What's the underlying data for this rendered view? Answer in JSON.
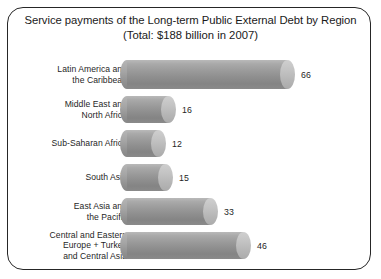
{
  "figure": {
    "title_line1": "Service payments of the Long-term Public External Debt by Region",
    "title_line2": "(Total: $188 billion in 2007)",
    "frame_color": "#262626",
    "bar_color": "#9a9a9a",
    "bar_cap_color": "#c3c3c3",
    "background": "#ffffff",
    "text_color": "#1f1f1f"
  },
  "chart_data": {
    "type": "bar",
    "orientation": "horizontal",
    "title": "Service payments of the Long-term Public External Debt by Region",
    "subtitle": "(Total: $188 billion in 2007)",
    "xlabel": "",
    "ylabel": "",
    "units": "US$ billion",
    "total": 188,
    "year": 2007,
    "grid": false,
    "legend": "none",
    "xlim": [
      0,
      70
    ],
    "categories": [
      "Latin America and the Caribbean",
      "Middle East and North Africa",
      "Sub-Saharan Africa",
      "South Asia",
      "East Asia and the Pacific",
      "Central and Eastern Europe + Turkey and Central Asia"
    ],
    "values": [
      66,
      16,
      12,
      15,
      33,
      46
    ]
  },
  "rows": [
    {
      "label_lines": [
        "Latin America and",
        "the Caribbean"
      ],
      "value": 66,
      "value_text": "66",
      "top": 60,
      "height": 29,
      "length": 160
    },
    {
      "label_lines": [
        "Middle East and",
        "North Africa"
      ],
      "value": 16,
      "value_text": "16",
      "top": 96,
      "height": 27,
      "length": 41
    },
    {
      "label_lines": [
        "Sub-Saharan Africa"
      ],
      "value": 12,
      "value_text": "12",
      "top": 130,
      "height": 27,
      "length": 31
    },
    {
      "label_lines": [
        "South Asia"
      ],
      "value": 15,
      "value_text": "15",
      "top": 164,
      "height": 27,
      "length": 38
    },
    {
      "label_lines": [
        "East Asia and",
        "the Pacific"
      ],
      "value": 33,
      "value_text": "33",
      "top": 198,
      "height": 27,
      "length": 83
    },
    {
      "label_lines": [
        "Central and Eastern",
        "Europe + Turkey",
        "and Central Asia"
      ],
      "value": 46,
      "value_text": "46",
      "top": 232,
      "height": 27,
      "length": 116
    }
  ]
}
